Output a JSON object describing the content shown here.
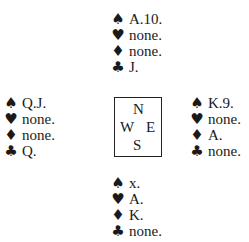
{
  "suits": {
    "spades": "♠",
    "hearts": "♥",
    "diamonds": "♦",
    "clubs": "♣"
  },
  "compass": {
    "north": "N",
    "west": "W",
    "east": "E",
    "south": "S"
  },
  "hands": {
    "north": {
      "spades": "A.10.",
      "hearts": "none.",
      "diamonds": "none.",
      "clubs": "J."
    },
    "west": {
      "spades": "Q.J.",
      "hearts": "none.",
      "diamonds": "none.",
      "clubs": "Q."
    },
    "east": {
      "spades": "K.9.",
      "hearts": "none.",
      "diamonds": "A.",
      "clubs": "none."
    },
    "south": {
      "spades": "x.",
      "hearts": "A.",
      "diamonds": "K.",
      "clubs": "none."
    }
  }
}
